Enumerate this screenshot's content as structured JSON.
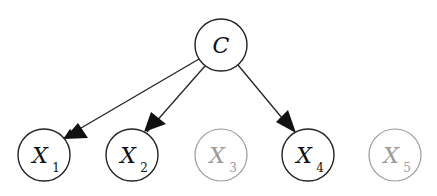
{
  "diagram": {
    "type": "bayesian-network",
    "nodes": [
      {
        "id": "C",
        "label": "C",
        "sub": "",
        "x": 221,
        "y": 45,
        "active": true
      },
      {
        "id": "X1",
        "label": "X",
        "sub": "1",
        "x": 44,
        "y": 155,
        "active": true
      },
      {
        "id": "X2",
        "label": "X",
        "sub": "2",
        "x": 132,
        "y": 155,
        "active": true
      },
      {
        "id": "X3",
        "label": "X",
        "sub": "3",
        "x": 221,
        "y": 155,
        "active": false
      },
      {
        "id": "X4",
        "label": "X",
        "sub": "4",
        "x": 308,
        "y": 155,
        "active": true
      },
      {
        "id": "X5",
        "label": "X",
        "sub": "5",
        "x": 395,
        "y": 155,
        "active": false
      }
    ],
    "edges": [
      {
        "from": "C",
        "to": "X1"
      },
      {
        "from": "C",
        "to": "X2"
      },
      {
        "from": "C",
        "to": "X4"
      }
    ],
    "colors": {
      "active_stroke": "#222222",
      "inactive_stroke": "#999999",
      "active_text": "#111111",
      "inactive_text": "#9a9a9a"
    }
  }
}
